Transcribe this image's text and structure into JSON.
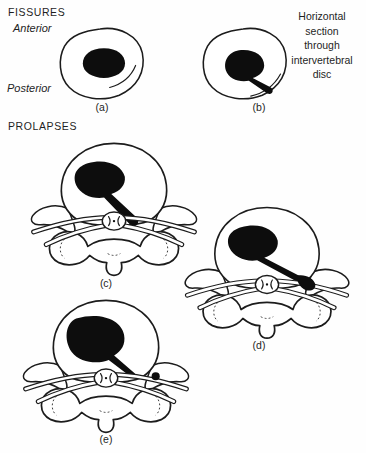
{
  "page": {
    "background_color": "#fefefe",
    "ink_color": "#1c1c1c"
  },
  "sections": {
    "fissures": {
      "heading": "FISSURES",
      "anterior_label": "Anterior",
      "posterior_label": "Posterior",
      "annotation": {
        "text": "Horizontal section through intervertebral disc",
        "lines": [
          "Horizontal",
          "section",
          "through",
          "intervertebral",
          "disc"
        ]
      },
      "figures": [
        {
          "id": "a",
          "caption": "(a)",
          "description": "disc with circumferential fissure"
        },
        {
          "id": "b",
          "caption": "(b)",
          "description": "disc with radial fissure filled by nucleus"
        }
      ]
    },
    "prolapses": {
      "heading": "PROLAPSES",
      "figures": [
        {
          "id": "c",
          "caption": "(c)",
          "description": "posterolateral prolapse reaching nerve root"
        },
        {
          "id": "d",
          "caption": "(d)",
          "description": "lateral prolapse compressing nerve root"
        },
        {
          "id": "e",
          "caption": "(e)",
          "description": "posterior prolapse with sequestrated fragment"
        }
      ]
    }
  }
}
